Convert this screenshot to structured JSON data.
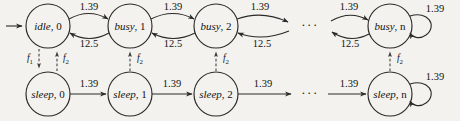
{
  "diagram": {
    "type": "state-transition-diagram",
    "title": "",
    "background_color": "#f3f2ee",
    "stroke_color": "#2b2a28",
    "layout": {
      "rows": [
        "busy-row",
        "sleep-row"
      ],
      "row_y": [
        26,
        94
      ],
      "node_radius": 22,
      "node_x": [
        48,
        130,
        216,
        390
      ],
      "ellipsis_x": 310
    },
    "nodes": [
      {
        "id": "idle-0",
        "state": "idle",
        "index": "0",
        "label": "idle, 0",
        "row": "busy-row",
        "x": 48,
        "y": 26,
        "self_loop": false
      },
      {
        "id": "busy-1",
        "state": "busy",
        "index": "1",
        "label": "busy, 1",
        "row": "busy-row",
        "x": 130,
        "y": 26,
        "self_loop": false
      },
      {
        "id": "busy-2",
        "state": "busy",
        "index": "2",
        "label": "busy, 2",
        "row": "busy-row",
        "x": 216,
        "y": 26,
        "self_loop": false
      },
      {
        "id": "busy-n",
        "state": "busy",
        "index": "n",
        "label": "busy, n",
        "row": "busy-row",
        "x": 390,
        "y": 26,
        "self_loop": true
      },
      {
        "id": "sleep-0",
        "state": "sleep",
        "index": "0",
        "label": "sleep, 0",
        "row": "sleep-row",
        "x": 48,
        "y": 94,
        "self_loop": false
      },
      {
        "id": "sleep-1",
        "state": "sleep",
        "index": "1",
        "label": "sleep, 1",
        "row": "sleep-row",
        "x": 130,
        "y": 94,
        "self_loop": false
      },
      {
        "id": "sleep-2",
        "state": "sleep",
        "index": "2",
        "label": "sleep, 2",
        "row": "sleep-row",
        "x": 216,
        "y": 94,
        "self_loop": false
      },
      {
        "id": "sleep-n",
        "state": "sleep",
        "index": "n",
        "label": "sleep, n",
        "row": "sleep-row",
        "x": 390,
        "y": 94,
        "self_loop": true
      }
    ],
    "ellipses": [
      {
        "id": "ellipsis-busy",
        "text": "···",
        "x": 310,
        "y": 26
      },
      {
        "id": "ellipsis-sleep",
        "text": "···",
        "x": 310,
        "y": 94
      }
    ],
    "rates": {
      "arrival": "1.39",
      "service": "12.5"
    },
    "edges": [
      {
        "id": "entry-idle-0",
        "from": "external",
        "to": "idle-0",
        "label": "",
        "style": "solid",
        "shape": "straight"
      },
      {
        "id": "idle0-to-busy1",
        "from": "idle-0",
        "to": "busy-1",
        "label": "1.39",
        "style": "solid",
        "shape": "arc-up"
      },
      {
        "id": "busy1-to-idle0",
        "from": "busy-1",
        "to": "idle-0",
        "label": "12.5",
        "style": "solid",
        "shape": "arc-down"
      },
      {
        "id": "busy1-to-busy2",
        "from": "busy-1",
        "to": "busy-2",
        "label": "1.39",
        "style": "solid",
        "shape": "arc-up"
      },
      {
        "id": "busy2-to-busy1",
        "from": "busy-2",
        "to": "busy-1",
        "label": "12.5",
        "style": "solid",
        "shape": "arc-down"
      },
      {
        "id": "busy2-to-ellipsis",
        "from": "busy-2",
        "to": "ellipsis-busy",
        "label": "1.39",
        "style": "solid",
        "shape": "arc-up"
      },
      {
        "id": "ellipsis-to-busy2",
        "from": "ellipsis-busy",
        "to": "busy-2",
        "label": "12.5",
        "style": "solid",
        "shape": "arc-down"
      },
      {
        "id": "ellipsis-to-busyn",
        "from": "ellipsis-busy",
        "to": "busy-n",
        "label": "1.39",
        "style": "solid",
        "shape": "arc-up"
      },
      {
        "id": "busyn-to-ellipsis",
        "from": "busy-n",
        "to": "ellipsis-busy",
        "label": "12.5",
        "style": "solid",
        "shape": "arc-down"
      },
      {
        "id": "busyn-self-loop",
        "from": "busy-n",
        "to": "busy-n",
        "label": "1.39",
        "style": "solid",
        "shape": "self-loop"
      },
      {
        "id": "sleep0-to-sleep1",
        "from": "sleep-0",
        "to": "sleep-1",
        "label": "1.39",
        "style": "solid",
        "shape": "straight"
      },
      {
        "id": "sleep1-to-sleep2",
        "from": "sleep-1",
        "to": "sleep-2",
        "label": "1.39",
        "style": "solid",
        "shape": "straight"
      },
      {
        "id": "sleep2-to-ellipsis",
        "from": "sleep-2",
        "to": "ellipsis-sleep",
        "label": "1.39",
        "style": "solid",
        "shape": "straight"
      },
      {
        "id": "ellipsis-to-sleepn",
        "from": "ellipsis-sleep",
        "to": "sleep-n",
        "label": "1.39",
        "style": "solid",
        "shape": "straight"
      },
      {
        "id": "sleepn-self-loop",
        "from": "sleep-n",
        "to": "sleep-n",
        "label": "1.39",
        "style": "solid",
        "shape": "self-loop"
      },
      {
        "id": "idle0-to-sleep0",
        "from": "idle-0",
        "to": "sleep-0",
        "label": "f1",
        "style": "dashed",
        "shape": "vertical-down"
      },
      {
        "id": "sleep0-to-idle0",
        "from": "sleep-0",
        "to": "idle-0",
        "label": "f2",
        "style": "dashed",
        "shape": "vertical-up"
      },
      {
        "id": "sleep1-to-busy1",
        "from": "sleep-1",
        "to": "busy-1",
        "label": "f2",
        "style": "dashed",
        "shape": "vertical-up"
      },
      {
        "id": "sleep2-to-busy2",
        "from": "sleep-2",
        "to": "busy-2",
        "label": "f2",
        "style": "dashed",
        "shape": "vertical-up"
      },
      {
        "id": "sleepn-to-busyn",
        "from": "sleep-n",
        "to": "busy-n",
        "label": "f2",
        "style": "dashed",
        "shape": "vertical-up"
      }
    ],
    "transition_labels": {
      "col0_top": "1.39",
      "col0_bottom": "12.5",
      "col1_top": "1.39",
      "col1_bottom": "12.5",
      "col2_top": "1.39",
      "col2_bottom": "12.5",
      "col3_top": "1.39",
      "col3_bottom": "12.5",
      "busy_n_loop": "1.39",
      "sleep_n_loop": "1.39",
      "sleep_seg0": "1.39",
      "sleep_seg1": "1.39",
      "sleep_seg2": "1.39",
      "sleep_seg3": "1.39"
    },
    "f_labels": {
      "f1_base": "f",
      "f1_sub": "1",
      "f2_base": "f",
      "f2_sub": "2"
    },
    "node_text": {
      "idle_0_state": "idle",
      "idle_0_idx": ", 0",
      "busy_1_state": "busy",
      "busy_1_idx": ", 1",
      "busy_2_state": "busy",
      "busy_2_idx": ", 2",
      "busy_n_state": "busy",
      "busy_n_idx": ", n",
      "sleep_0_state": "sleep",
      "sleep_0_idx": ", 0",
      "sleep_1_state": "sleep",
      "sleep_1_idx": ", 1",
      "sleep_2_state": "sleep",
      "sleep_2_idx": ", 2",
      "sleep_n_state": "sleep",
      "sleep_n_idx": ", n"
    },
    "ellipsis_text": "···"
  }
}
